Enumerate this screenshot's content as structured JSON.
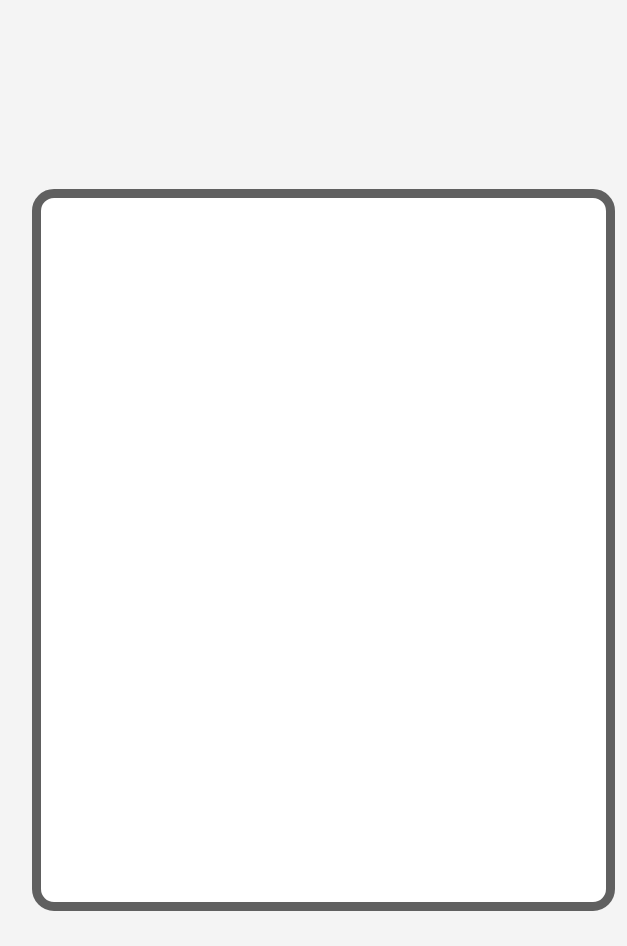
{
  "page": {
    "background_color": "#f4f4f4"
  },
  "frame": {
    "border_color": "#606060",
    "fill_color": "#ffffff",
    "content": ""
  }
}
